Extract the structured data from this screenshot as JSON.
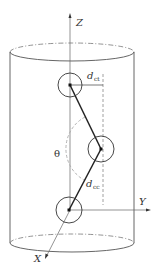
{
  "figure": {
    "axes": {
      "z_label": "Z",
      "y_label": "Y",
      "x_label": "X"
    },
    "labels": {
      "d_ct_main": "d",
      "d_ct_sub": "ct",
      "d_cc_main": "d",
      "d_cc_sub": "cc",
      "theta": "θ"
    },
    "colors": {
      "line": "#333333",
      "outline": "#555555",
      "dashed": "#888888",
      "arc": "#aaaaaa"
    }
  }
}
